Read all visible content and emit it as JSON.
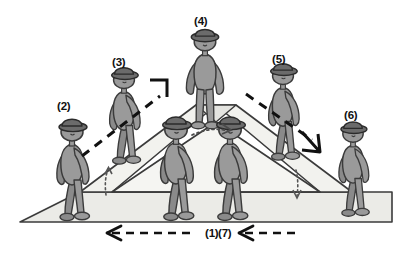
{
  "figure": {
    "type": "technical-illustration",
    "background_color": "#ffffff"
  },
  "colors": {
    "body_fill": "#9a9a9a",
    "body_stroke": "#3a3a3a",
    "hat_fill": "#6b6b6b",
    "hat_stroke": "#2b2b2b",
    "limb_fill": "#8d8d8d",
    "ramp_face_fill": "#e9e9e5",
    "ramp_top_fill": "#f2f2ee",
    "ground_fill": "#ebebe7",
    "outline": "#3b3b3b",
    "arrow": "#111111",
    "label_text": "#111111"
  },
  "labels": [
    {
      "id": "label-1",
      "text": "(1)",
      "x": 205,
      "y": 228
    },
    {
      "id": "label-2",
      "text": "(2)",
      "x": 57,
      "y": 101
    },
    {
      "id": "label-3",
      "text": "(3)",
      "x": 112,
      "y": 57
    },
    {
      "id": "label-4",
      "text": "(4)",
      "x": 194,
      "y": 16
    },
    {
      "id": "label-5",
      "text": "(5)",
      "x": 272,
      "y": 54
    },
    {
      "id": "label-6",
      "text": "(6)",
      "x": 344,
      "y": 110
    },
    {
      "id": "label-7",
      "text": "(7)",
      "x": 218,
      "y": 228
    }
  ],
  "arrows": {
    "bottom_left": {
      "name": "arrow-1",
      "direction": "left",
      "style": "dashed",
      "label": "(1)"
    },
    "bottom_right": {
      "name": "arrow-7",
      "direction": "left",
      "style": "dashed",
      "label": "(7)"
    },
    "up_slope": {
      "name": "arrow-up-slope",
      "direction": "up-right",
      "style": "dashed"
    },
    "down_slope": {
      "name": "arrow-down-slope",
      "direction": "down-right",
      "style": "dashed"
    },
    "apex_angle": {
      "name": "arrow-apex-angle",
      "direction": "curved",
      "style": "dotted"
    },
    "left_angle": {
      "name": "arrow-left-angle",
      "direction": "up",
      "style": "dotted"
    },
    "right_angle": {
      "name": "arrow-right-angle",
      "direction": "down",
      "style": "dotted"
    }
  },
  "people": [
    {
      "id": "person-2",
      "label": "(2)",
      "x": 72,
      "y": 168,
      "scale": 1.0,
      "facing": "right",
      "pose": "arm-out",
      "on": "ground"
    },
    {
      "id": "person-3",
      "label": "(3)",
      "x": 124,
      "y": 118,
      "scale": 0.95,
      "facing": "right",
      "pose": "walking",
      "on": "left-slope"
    },
    {
      "id": "person-4",
      "label": "(4)",
      "x": 205,
      "y": 76,
      "scale": 0.98,
      "facing": "front",
      "pose": "standing",
      "on": "apex"
    },
    {
      "id": "person-5",
      "label": "(5)",
      "x": 283,
      "y": 112,
      "scale": 0.95,
      "facing": "right",
      "pose": "walking",
      "on": "right-slope"
    },
    {
      "id": "person-6",
      "label": "(6)",
      "x": 353,
      "y": 168,
      "scale": 0.93,
      "facing": "right",
      "pose": "standing",
      "on": "ground"
    },
    {
      "id": "person-center-left",
      "label": "",
      "x": 176,
      "y": 166,
      "scale": 1.02,
      "facing": "right",
      "pose": "walking",
      "on": "ground"
    },
    {
      "id": "person-center-right",
      "label": "",
      "x": 230,
      "y": 166,
      "scale": 1.02,
      "facing": "right",
      "pose": "walking",
      "on": "ground"
    }
  ]
}
